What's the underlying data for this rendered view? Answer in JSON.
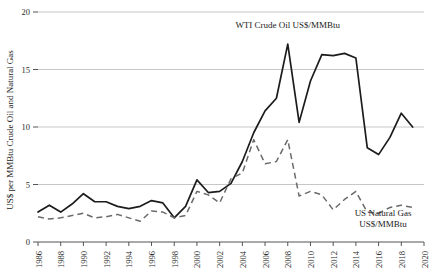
{
  "chart_data": {
    "type": "line",
    "title": "",
    "xlabel": "",
    "ylabel": "US$ per MMBtu Crude Oil and Natural Gas",
    "xlim": [
      1986,
      2020
    ],
    "ylim": [
      0,
      20
    ],
    "yticks": [
      0,
      5,
      10,
      15,
      20
    ],
    "xticks": [
      1986,
      1988,
      1990,
      1992,
      1994,
      1996,
      1998,
      2000,
      2002,
      2004,
      2006,
      2008,
      2010,
      2012,
      2014,
      2016,
      2018,
      2020
    ],
    "grid": "horizontal",
    "legend": "inline-annotations",
    "annotations": [
      {
        "name": "oil-label",
        "text": "WTI Crude Oil US$/MMBtu",
        "x": 2008,
        "y": 18.6
      },
      {
        "name": "gas-label-line1",
        "text": "US Natural Gas",
        "x": 2016.4,
        "y": 2.3
      },
      {
        "name": "gas-label-line2",
        "text": "US$/MMBtu",
        "x": 2016.4,
        "y": 1.3
      }
    ],
    "x": [
      1986,
      1987,
      1988,
      1989,
      1990,
      1991,
      1992,
      1993,
      1994,
      1995,
      1996,
      1997,
      1998,
      1999,
      2000,
      2001,
      2002,
      2003,
      2004,
      2005,
      2006,
      2007,
      2008,
      2009,
      2010,
      2011,
      2012,
      2013,
      2014,
      2015,
      2016,
      2017,
      2018,
      2019
    ],
    "series": [
      {
        "name": "WTI Crude Oil US$/MMBtu",
        "style": "solid",
        "color": "#1c1c1c",
        "values": [
          2.6,
          3.2,
          2.6,
          3.3,
          4.2,
          3.5,
          3.5,
          3.1,
          2.9,
          3.1,
          3.6,
          3.4,
          2.1,
          3.1,
          5.4,
          4.3,
          4.4,
          5.1,
          7.0,
          9.5,
          11.4,
          12.5,
          17.2,
          10.4,
          14.0,
          16.3,
          16.2,
          16.4,
          16.0,
          8.2,
          7.6,
          9.1,
          11.2,
          10.0
        ]
      },
      {
        "name": "US Natural Gas US$/MMBtu",
        "style": "dashed",
        "color": "#6a6a6a",
        "values": [
          2.2,
          2.0,
          2.1,
          2.3,
          2.5,
          2.1,
          2.2,
          2.4,
          2.1,
          1.8,
          2.7,
          2.6,
          2.1,
          2.3,
          4.4,
          4.1,
          3.4,
          5.5,
          6.0,
          8.9,
          6.8,
          7.0,
          8.9,
          4.0,
          4.4,
          4.1,
          2.8,
          3.7,
          4.4,
          2.6,
          2.5,
          3.0,
          3.2,
          3.0
        ]
      }
    ]
  }
}
